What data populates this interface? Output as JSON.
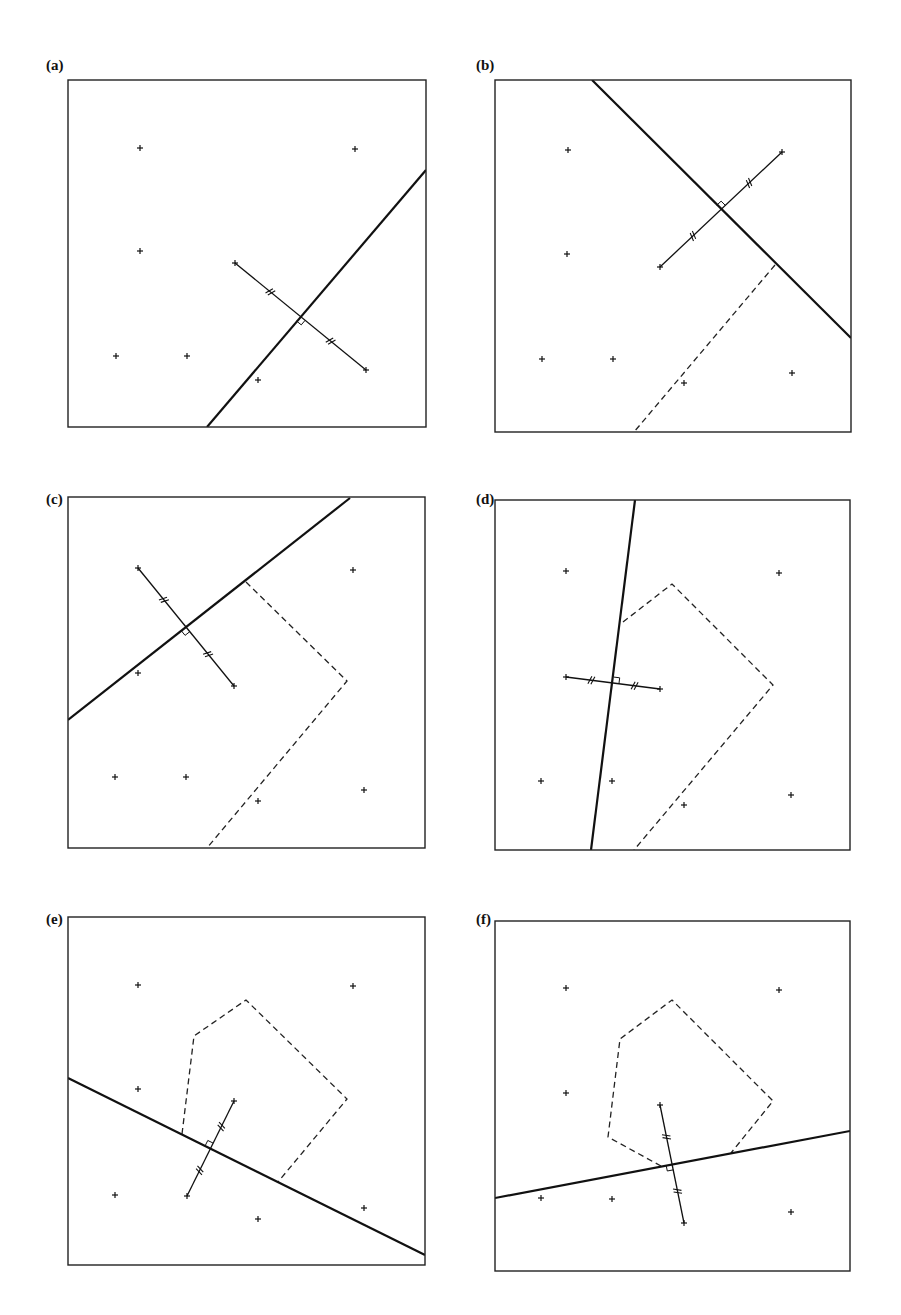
{
  "figure": {
    "panels": [
      {
        "id": "a",
        "label": "(a)",
        "label_pos": [
          46,
          57
        ],
        "box": [
          68,
          80,
          426,
          427
        ],
        "points": [
          [
            140,
            148
          ],
          [
            355,
            149
          ],
          [
            140,
            251
          ],
          [
            116,
            356
          ],
          [
            187,
            356
          ],
          [
            258,
            380
          ]
        ],
        "bisector": [
          [
            207,
            427
          ],
          [
            426,
            170
          ]
        ],
        "segment": [
          [
            235,
            263
          ],
          [
            366,
            370
          ]
        ],
        "dashed": []
      },
      {
        "id": "b",
        "label": "(b)",
        "label_pos": [
          476,
          57
        ],
        "box": [
          495,
          80,
          851,
          432
        ],
        "points": [
          [
            568,
            150
          ],
          [
            567,
            254
          ],
          [
            542,
            359
          ],
          [
            613,
            359
          ],
          [
            684,
            383
          ],
          [
            792,
            373
          ]
        ],
        "bisector": [
          [
            592,
            80
          ],
          [
            851,
            338
          ]
        ],
        "segment": [
          [
            660,
            267
          ],
          [
            782,
            152
          ]
        ],
        "dashed": [
          [
            [
              775,
              265
            ],
            [
              634,
              432
            ]
          ]
        ]
      },
      {
        "id": "c",
        "label": "(c)",
        "label_pos": [
          46,
          491
        ],
        "box": [
          68,
          497,
          425,
          848
        ],
        "points": [
          [
            353,
            570
          ],
          [
            138,
            673
          ],
          [
            115,
            777
          ],
          [
            186,
            777
          ],
          [
            258,
            801
          ],
          [
            364,
            790
          ]
        ],
        "bisector": [
          [
            68,
            720
          ],
          [
            350,
            498
          ]
        ],
        "segment": [
          [
            138,
            568
          ],
          [
            234,
            686
          ]
        ],
        "dashed": [
          [
            [
              246,
              582
            ],
            [
              347,
              681
            ],
            [
              207,
              848
            ]
          ]
        ]
      },
      {
        "id": "d",
        "label": "(d)",
        "label_pos": [
          476,
          491
        ],
        "box": [
          495,
          500,
          850,
          850
        ],
        "points": [
          [
            566,
            571
          ],
          [
            779,
            573
          ],
          [
            541,
            781
          ],
          [
            612,
            781
          ],
          [
            684,
            805
          ],
          [
            791,
            795
          ]
        ],
        "bisector": [
          [
            635,
            500
          ],
          [
            591,
            850
          ]
        ],
        "segment": [
          [
            566,
            677
          ],
          [
            660,
            689
          ]
        ],
        "dashed": [
          [
            [
              623,
              622
            ],
            [
              672,
              584
            ],
            [
              773,
              685
            ],
            [
              634,
              850
            ]
          ]
        ]
      },
      {
        "id": "e",
        "label": "(e)",
        "label_pos": [
          46,
          911
        ],
        "box": [
          68,
          917,
          425,
          1265
        ],
        "points": [
          [
            138,
            985
          ],
          [
            353,
            986
          ],
          [
            138,
            1089
          ],
          [
            115,
            1195
          ],
          [
            258,
            1219
          ],
          [
            364,
            1208
          ]
        ],
        "bisector": [
          [
            68,
            1078
          ],
          [
            425,
            1255
          ]
        ],
        "segment": [
          [
            187,
            1196
          ],
          [
            234,
            1101
          ]
        ],
        "dashed": [
          [
            [
              182,
              1134
            ],
            [
              194,
              1036
            ],
            [
              246,
              1000
            ],
            [
              347,
              1099
            ],
            [
              278,
              1182
            ]
          ]
        ]
      },
      {
        "id": "f",
        "label": "(f)",
        "label_pos": [
          476,
          911
        ],
        "box": [
          495,
          921,
          850,
          1271
        ],
        "points": [
          [
            566,
            988
          ],
          [
            779,
            990
          ],
          [
            566,
            1093
          ],
          [
            541,
            1198
          ],
          [
            612,
            1199
          ],
          [
            791,
            1212
          ]
        ],
        "bisector": [
          [
            495,
            1198
          ],
          [
            850,
            1131
          ]
        ],
        "segment": [
          [
            660,
            1105
          ],
          [
            684,
            1223
          ]
        ],
        "dashed": [
          [
            [
              661,
              1166
            ],
            [
              608,
              1137
            ],
            [
              620,
              1039
            ],
            [
              672,
              1000
            ],
            [
              773,
              1101
            ],
            [
              731,
              1153
            ]
          ]
        ]
      }
    ]
  }
}
